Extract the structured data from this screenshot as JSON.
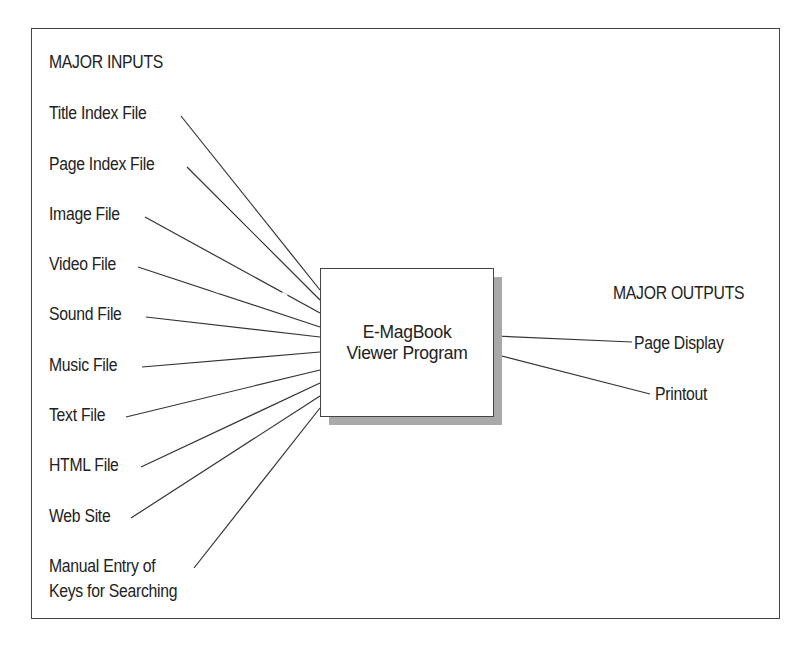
{
  "diagram": {
    "inputs_header": "MAJOR INPUTS",
    "outputs_header": "MAJOR OUTPUTS",
    "central_process": {
      "line1": "E-MagBook",
      "line2": "Viewer Program"
    },
    "inputs": [
      {
        "label": "Title Index File"
      },
      {
        "label": "Page Index File"
      },
      {
        "label": "Image File"
      },
      {
        "label": "Video File"
      },
      {
        "label": "Sound File"
      },
      {
        "label": "Music File"
      },
      {
        "label": "Text File"
      },
      {
        "label": "HTML File"
      },
      {
        "label": "Web Site"
      },
      {
        "label": "Manual Entry of",
        "label_line2": "Keys for Searching"
      }
    ],
    "outputs": [
      {
        "label": "Page Display"
      },
      {
        "label": "Printout"
      }
    ],
    "colors": {
      "line": "#333333",
      "shadow": "#a9a9a9",
      "border": "#444444"
    }
  }
}
